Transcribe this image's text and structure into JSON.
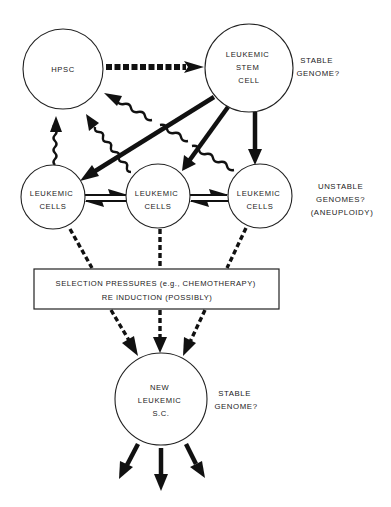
{
  "diagram": {
    "nodes": {
      "hpsc": {
        "lines": [
          "HPSC"
        ]
      },
      "leukemic_stem_cell": {
        "lines": [
          "LEUKEMIC",
          "STEM",
          "CELL"
        ]
      },
      "leukemic_cells_left": {
        "lines": [
          "LEUKEMIC",
          "CELLS"
        ]
      },
      "leukemic_cells_middle": {
        "lines": [
          "LEUKEMIC",
          "CELLS"
        ]
      },
      "leukemic_cells_right": {
        "lines": [
          "LEUKEMIC",
          "CELLS"
        ]
      },
      "new_leukemic_sc": {
        "lines": [
          "NEW",
          "LEUKEMIC",
          "S.C."
        ]
      }
    },
    "annotations": {
      "top": {
        "lines": [
          "STABLE",
          "GENOME?"
        ]
      },
      "middle": {
        "lines": [
          "UNSTABLE",
          "GENOMES?",
          "(ANEUPLOIDY)"
        ]
      },
      "bottom": {
        "lines": [
          "STABLE",
          "GENOME?"
        ]
      }
    },
    "selection_box": {
      "lines": [
        "SELECTION PRESSURES (e.g., CHEMOTHERAPY)",
        "RE INDUCTION (POSSIBLY)"
      ]
    },
    "edges": [
      {
        "from": "HPSC",
        "to": "LEUKEMIC STEM CELL",
        "style": "thick-dashed"
      },
      {
        "from": "LEUKEMIC STEM CELL",
        "to": "LEUKEMIC CELLS (left)",
        "style": "solid"
      },
      {
        "from": "LEUKEMIC STEM CELL",
        "to": "LEUKEMIC CELLS (middle)",
        "style": "solid"
      },
      {
        "from": "LEUKEMIC STEM CELL",
        "to": "LEUKEMIC CELLS (right)",
        "style": "solid"
      },
      {
        "from": "LEUKEMIC CELLS (left)",
        "to": "HPSC",
        "style": "wavy"
      },
      {
        "from": "LEUKEMIC CELLS (middle)",
        "to": "HPSC",
        "style": "wavy"
      },
      {
        "from": "LEUKEMIC CELLS (right)",
        "to": "HPSC",
        "style": "wavy"
      },
      {
        "from": "LEUKEMIC CELLS (left)",
        "to": "LEUKEMIC CELLS (middle)",
        "style": "reversible"
      },
      {
        "from": "LEUKEMIC CELLS (middle)",
        "to": "LEUKEMIC CELLS (right)",
        "style": "reversible"
      },
      {
        "from": "LEUKEMIC CELLS",
        "to": "SELECTION PRESSURES",
        "style": "dashed",
        "count": 3
      },
      {
        "from": "SELECTION PRESSURES",
        "to": "NEW LEUKEMIC S.C.",
        "style": "dashed",
        "count": 3
      },
      {
        "from": "NEW LEUKEMIC S.C.",
        "to": "outputs",
        "style": "solid",
        "count": 3
      }
    ]
  }
}
